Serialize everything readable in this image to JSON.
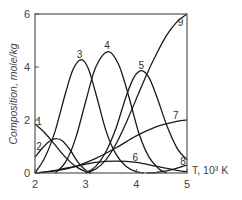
{
  "chart_data": {
    "type": "line",
    "title": "",
    "xlabel": "T, 10³ K",
    "ylabel": "Composition, mole/kg",
    "xlim": [
      2,
      5
    ],
    "ylim": [
      0,
      6
    ],
    "x_ticks": [
      "2",
      "3",
      "4",
      "5"
    ],
    "y_ticks": [
      "0",
      "2",
      "4",
      "6"
    ],
    "grid": false,
    "legend": "inline curve numbers",
    "series": [
      {
        "name": "1",
        "x": [
          2.0,
          2.2,
          2.4,
          2.6,
          2.8,
          3.0,
          3.1
        ],
        "y": [
          1.85,
          1.5,
          1.05,
          0.6,
          0.25,
          0.05,
          0.0
        ]
      },
      {
        "name": "2",
        "x": [
          2.0,
          2.15,
          2.3,
          2.43,
          2.55,
          2.7,
          2.85,
          3.0,
          3.1
        ],
        "y": [
          0.6,
          0.95,
          1.22,
          1.3,
          1.2,
          0.85,
          0.4,
          0.1,
          0.0
        ]
      },
      {
        "name": "3",
        "x": [
          2.0,
          2.2,
          2.4,
          2.6,
          2.75,
          2.91,
          3.05,
          3.2,
          3.4,
          3.6,
          3.8,
          4.0,
          4.15
        ],
        "y": [
          0.0,
          0.6,
          1.6,
          3.0,
          3.9,
          4.28,
          3.95,
          3.0,
          1.6,
          0.7,
          0.25,
          0.05,
          0.0
        ]
      },
      {
        "name": "4",
        "x": [
          2.4,
          2.6,
          2.8,
          3.0,
          3.2,
          3.44,
          3.65,
          3.85,
          4.05,
          4.25,
          4.45,
          4.6
        ],
        "y": [
          0.0,
          0.4,
          1.3,
          2.7,
          4.0,
          4.58,
          4.1,
          2.9,
          1.5,
          0.6,
          0.15,
          0.0
        ]
      },
      {
        "name": "5",
        "x": [
          3.0,
          3.2,
          3.4,
          3.6,
          3.8,
          3.95,
          4.1,
          4.25,
          4.4,
          4.6,
          4.8,
          5.0
        ],
        "y": [
          0.0,
          0.25,
          0.8,
          1.7,
          2.9,
          3.6,
          3.86,
          3.6,
          2.9,
          1.8,
          0.95,
          0.5
        ]
      },
      {
        "name": "6",
        "x": [
          2.0,
          2.4,
          2.8,
          3.2,
          3.6,
          4.0,
          4.4,
          4.8,
          5.0
        ],
        "y": [
          0.0,
          0.1,
          0.25,
          0.4,
          0.45,
          0.4,
          0.25,
          0.1,
          0.05
        ]
      },
      {
        "name": "7",
        "x": [
          2.0,
          2.4,
          2.8,
          3.2,
          3.6,
          4.0,
          4.4,
          4.8,
          5.0
        ],
        "y": [
          0.0,
          0.08,
          0.25,
          0.55,
          0.95,
          1.4,
          1.75,
          1.95,
          2.0
        ]
      },
      {
        "name": "8",
        "x": [
          4.2,
          4.4,
          4.6,
          4.8,
          5.0
        ],
        "y": [
          0.0,
          0.02,
          0.08,
          0.18,
          0.3
        ]
      },
      {
        "name": "9",
        "x": [
          3.0,
          3.2,
          3.4,
          3.6,
          3.8,
          4.0,
          4.2,
          4.4,
          4.6,
          4.8,
          5.0
        ],
        "y": [
          0.0,
          0.15,
          0.5,
          1.1,
          1.9,
          2.8,
          3.7,
          4.5,
          5.2,
          5.7,
          6.0
        ]
      }
    ],
    "curve_label_positions": [
      {
        "name": "1",
        "x": 2.08,
        "y": 1.92
      },
      {
        "name": "2",
        "x": 2.08,
        "y": 1.0
      },
      {
        "name": "3",
        "x": 2.88,
        "y": 4.45
      },
      {
        "name": "4",
        "x": 3.42,
        "y": 4.78
      },
      {
        "name": "5",
        "x": 4.1,
        "y": 4.05
      },
      {
        "name": "6",
        "x": 3.98,
        "y": 0.55
      },
      {
        "name": "7",
        "x": 4.78,
        "y": 2.15
      },
      {
        "name": "8",
        "x": 4.92,
        "y": 0.42
      },
      {
        "name": "9",
        "x": 4.87,
        "y": 5.65
      }
    ]
  }
}
